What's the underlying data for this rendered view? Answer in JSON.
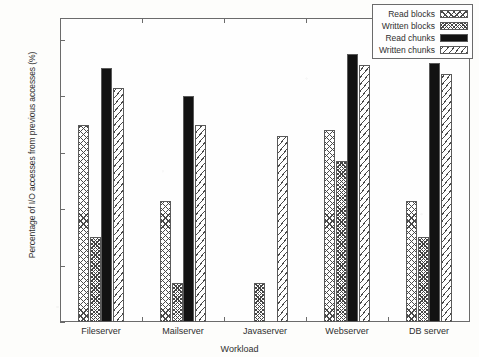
{
  "chart_data": {
    "type": "bar",
    "title": "",
    "xlabel": "Workload",
    "ylabel": "Percentage of I/O accesses from previous accesses (%)",
    "categories": [
      "Fileserver",
      "Mailserver",
      "Javaserver",
      "Webserver",
      "DB server"
    ],
    "series": [
      {
        "name": "Read blocks",
        "values": [
          70,
          43,
          null,
          68,
          43
        ]
      },
      {
        "name": "Written blocks",
        "values": [
          30,
          14,
          14,
          57,
          30
        ]
      },
      {
        "name": "Read chunks",
        "values": [
          90,
          80,
          null,
          95,
          92
        ]
      },
      {
        "name": "Written chunks",
        "values": [
          83,
          70,
          66,
          91,
          88
        ]
      }
    ],
    "ylim": [
      0,
      100
    ],
    "yticks": [
      0,
      20,
      40,
      60,
      80,
      100
    ],
    "ytick_labels": [
      "0",
      "20",
      "40",
      "60",
      "80",
      "100"
    ],
    "grid": false,
    "legend_position": "upper right",
    "legend_entries": [
      "Read blocks",
      "Written blocks",
      "Read chunks",
      "Written chunks"
    ],
    "patterns": [
      "crosshatch",
      "dense-crosshatch",
      "solid-black",
      "diagonal-hatch"
    ],
    "colors": {
      "ink": "#2f2f2f",
      "axis": "#6b6b6b",
      "solid_series": "#121212",
      "background": "#fefefe"
    }
  }
}
